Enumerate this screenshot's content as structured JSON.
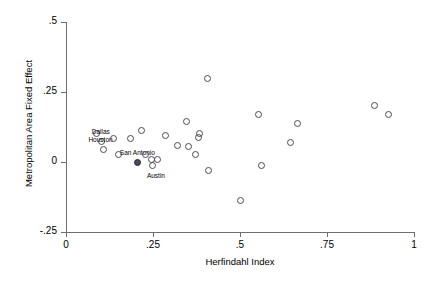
{
  "chart_data": {
    "type": "scatter",
    "title": "",
    "xlabel": "Herfindahl Index",
    "ylabel": "Metropolitan Area Fixed Effect",
    "xlim": [
      0,
      1
    ],
    "ylim": [
      -0.25,
      0.5
    ],
    "xticks": [
      "0",
      ".25",
      ".5",
      ".75",
      "1"
    ],
    "xtick_values": [
      0,
      0.25,
      0.5,
      0.75,
      1
    ],
    "yticks": [
      ".5",
      ".25",
      "0",
      "-.25"
    ],
    "ytick_values": [
      0.5,
      0.25,
      0,
      -0.25
    ],
    "grid": false,
    "legend": "none",
    "marker_style": "open-circle",
    "points": [
      {
        "x": 0.085,
        "y": 0.105,
        "label": ""
      },
      {
        "x": 0.1,
        "y": 0.075,
        "label": "Dallas",
        "label_dx": 0,
        "label_dy": -9
      },
      {
        "x": 0.105,
        "y": 0.045,
        "label": "Houston",
        "label_dx": -2,
        "label_dy": -9
      },
      {
        "x": 0.135,
        "y": 0.085,
        "label": ""
      },
      {
        "x": 0.15,
        "y": 0.03,
        "label": ""
      },
      {
        "x": 0.185,
        "y": 0.085,
        "label": ""
      },
      {
        "x": 0.205,
        "y": 0.0,
        "label": "San Antonio",
        "label_dx": 0,
        "label_dy": -9,
        "highlight": true
      },
      {
        "x": 0.215,
        "y": 0.115,
        "label": ""
      },
      {
        "x": 0.228,
        "y": 0.028,
        "label": ""
      },
      {
        "x": 0.243,
        "y": 0.012,
        "label": ""
      },
      {
        "x": 0.247,
        "y": -0.01,
        "label": "Austin",
        "label_dx": 4,
        "label_dy": 11
      },
      {
        "x": 0.262,
        "y": 0.012,
        "label": ""
      },
      {
        "x": 0.285,
        "y": 0.095,
        "label": ""
      },
      {
        "x": 0.318,
        "y": 0.06,
        "label": ""
      },
      {
        "x": 0.345,
        "y": 0.145,
        "label": ""
      },
      {
        "x": 0.352,
        "y": 0.058,
        "label": ""
      },
      {
        "x": 0.372,
        "y": 0.028,
        "label": ""
      },
      {
        "x": 0.378,
        "y": 0.09,
        "label": ""
      },
      {
        "x": 0.382,
        "y": 0.105,
        "label": ""
      },
      {
        "x": 0.405,
        "y": 0.3,
        "label": ""
      },
      {
        "x": 0.408,
        "y": -0.03,
        "label": ""
      },
      {
        "x": 0.5,
        "y": -0.135,
        "label": ""
      },
      {
        "x": 0.552,
        "y": 0.172,
        "label": ""
      },
      {
        "x": 0.56,
        "y": -0.012,
        "label": ""
      },
      {
        "x": 0.645,
        "y": 0.07,
        "label": ""
      },
      {
        "x": 0.665,
        "y": 0.14,
        "label": ""
      },
      {
        "x": 0.885,
        "y": 0.205,
        "label": ""
      },
      {
        "x": 0.925,
        "y": 0.17,
        "label": ""
      }
    ]
  },
  "axes": {
    "x_title": "Herfindahl Index",
    "y_title": "Metropolitan Area Fixed Effect"
  },
  "colors": {
    "marker_stroke": "#4a4a58",
    "axis": "#6e6e6e",
    "text": "#000000",
    "background": "#ffffff"
  }
}
